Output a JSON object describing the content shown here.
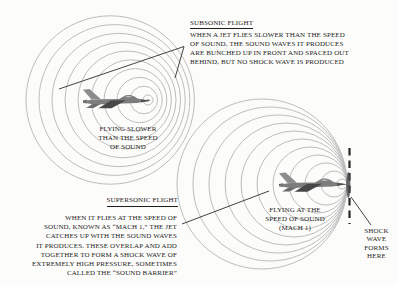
{
  "subsonic": {
    "heading": "SUBSONIC FLIGHT",
    "body_lines": [
      "WHEN A JET FLIES SLOWER THAN THE SPEED",
      "OF SOUND, THE SOUND WAVES IT PRODUCES",
      "ARE BUNCHED UP IN FRONT AND SPACED OUT",
      "BEHIND, BUT NO SHOCK WAVE IS PRODUCED"
    ],
    "jet_label_lines": [
      "FLYING SLOWER",
      "THAN THE SPEED",
      "OF SOUND"
    ]
  },
  "supersonic": {
    "heading": "SUPERSONIC FLIGHT",
    "body_lines": [
      "WHEN IT FLIES AT THE SPEED OF",
      "SOUND, KNOWN AS “MACH 1,” THE JET",
      "CATCHES UP WITH THE SOUND WAVES",
      "IT PRODUCES. THESE OVERLAP AND ADD",
      "TOGETHER TO FORM A SHOCK WAVE OF",
      "EXTREMELY HIGH PRESSURE, SOMETIMES",
      "CALLED THE “SOUND BARRIER”"
    ],
    "jet_label_lines": [
      "FLYING AT THE",
      "SPEED OF SOUND",
      "(MACH 1)"
    ],
    "shock_label_lines": [
      "SHOCK",
      "WAVE",
      "FORMS",
      "HERE"
    ]
  },
  "colors": {
    "background": "#fcfcfa",
    "wave_circle": "#bdbdbd",
    "ink_text": "#1d1d1d",
    "pointer_line": "#2e2e2e",
    "shock_dash": "#262626"
  }
}
